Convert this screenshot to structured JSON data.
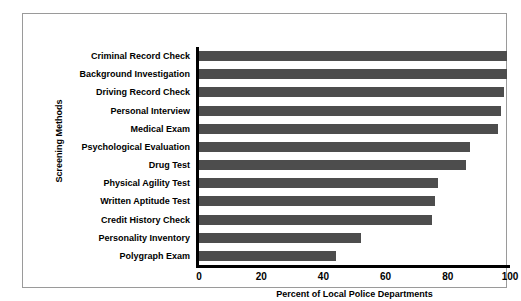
{
  "chart_data": {
    "type": "bar",
    "orientation": "horizontal",
    "title": "",
    "xlabel": "Percent of Local Police Departments",
    "ylabel": "Screening Methods",
    "xlim": [
      0,
      100
    ],
    "xticks": [
      "0",
      "20",
      "40",
      "60",
      "80",
      "100"
    ],
    "xtick_values": [
      0,
      20,
      40,
      60,
      80,
      100
    ],
    "grid": false,
    "legend": null,
    "bar_color": "#4d4d4d",
    "categories": [
      "Criminal Record Check",
      "Background Investigation",
      "Driving Record Check",
      "Personal Interview",
      "Medical Exam",
      "Psychological Evaluation",
      "Drug Test",
      "Physical Agility Test",
      "Written Aptitude Test",
      "Credit History Check",
      "Personality Inventory",
      "Polygraph Exam"
    ],
    "values": [
      99,
      99,
      98,
      97,
      96,
      87,
      86,
      77,
      76,
      75,
      52,
      44
    ]
  }
}
